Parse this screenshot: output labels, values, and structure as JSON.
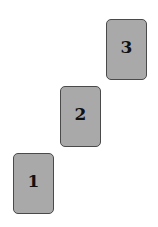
{
  "diagram": {
    "type": "staircase-cards",
    "cards": [
      {
        "label": "1",
        "x": 13,
        "y": 153
      },
      {
        "label": "2",
        "x": 60,
        "y": 86
      },
      {
        "label": "3",
        "x": 106,
        "y": 19
      }
    ],
    "colors": {
      "card_fill": "#a9a9a9",
      "card_border": "#4a4a4a",
      "label": "#111111",
      "background": "#ffffff"
    }
  }
}
